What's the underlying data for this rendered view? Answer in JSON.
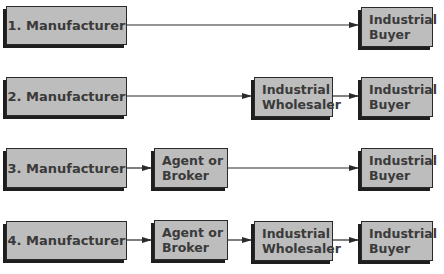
{
  "diagram": {
    "title": "",
    "channels": [
      {
        "id": 1,
        "nodes": [
          "1. Manufacturer",
          "Industrial Buyer"
        ]
      },
      {
        "id": 2,
        "nodes": [
          "2. Manufacturer",
          "Industrial Wholesaler",
          "Industrial Buyer"
        ]
      },
      {
        "id": 3,
        "nodes": [
          "3. Manufacturer",
          "Agent or Broker",
          "Industrial Buyer"
        ]
      },
      {
        "id": 4,
        "nodes": [
          "4. Manufacturer",
          "Agent or Broker",
          "Industrial Wholesaler",
          "Industrial Buyer"
        ]
      }
    ],
    "labels": {
      "m1": "1. Manufacturer",
      "m2": "2. Manufacturer",
      "m3": "3. Manufacturer",
      "m4": "4. Manufacturer",
      "industrial": "Industrial",
      "buyer": "Buyer",
      "wholesaler": "Wholesaler",
      "agent_or": "Agent or",
      "broker": "Broker"
    },
    "colors": {
      "box_fill": "#bdbdbd",
      "border": "#2a2a2a",
      "text": "#3a3a3a"
    }
  }
}
